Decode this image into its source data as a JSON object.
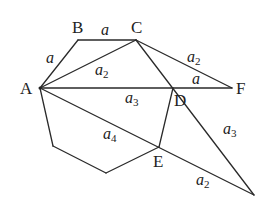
{
  "diagram": {
    "points": {
      "A": {
        "label": "A",
        "x": 40,
        "y": 88
      },
      "B": {
        "label": "B",
        "x": 78,
        "y": 40
      },
      "C": {
        "label": "C",
        "x": 136,
        "y": 40
      },
      "D": {
        "label": "D",
        "x": 173,
        "y": 88
      },
      "F": {
        "label": "F",
        "x": 232,
        "y": 88
      },
      "E": {
        "label": "E",
        "x": 159,
        "y": 147
      },
      "G": {
        "label": "",
        "x": 254,
        "y": 195
      },
      "H1": {
        "label": "",
        "x": 53,
        "y": 146
      },
      "H2": {
        "label": "",
        "x": 106,
        "y": 173
      }
    },
    "segment_labels": [
      {
        "id": "AB",
        "base": "a",
        "sub": ""
      },
      {
        "id": "BC",
        "base": "a",
        "sub": ""
      },
      {
        "id": "AC",
        "base": "a",
        "sub": "2"
      },
      {
        "id": "CF",
        "base": "a",
        "sub": "2"
      },
      {
        "id": "DF",
        "base": "a",
        "sub": ""
      },
      {
        "id": "AD",
        "base": "a",
        "sub": "3"
      },
      {
        "id": "AE",
        "base": "a",
        "sub": "4"
      },
      {
        "id": "DG",
        "base": "a",
        "sub": "3"
      },
      {
        "id": "EG",
        "base": "a",
        "sub": "2"
      }
    ]
  }
}
